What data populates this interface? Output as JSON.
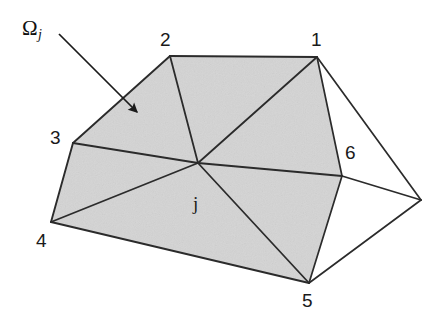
{
  "figure": {
    "background_color": "#ffffff",
    "shaded_fill_color": "#d4d4d4",
    "line_color": "#2b2b2b",
    "canvas": {
      "width": 439,
      "height": 323
    },
    "region_label": {
      "base": "Ω",
      "subscript": "j",
      "x": 22,
      "y": 18
    },
    "arrow": {
      "name": "omega-pointer-arrow",
      "start": {
        "x": 59,
        "y": 34
      },
      "end": {
        "x": 137,
        "y": 112
      }
    },
    "center_node": {
      "label": "j",
      "x": 198,
      "y": 163,
      "label_x": 193,
      "label_y": 194
    },
    "vertices": [
      {
        "id": "1",
        "x": 317,
        "y": 57,
        "label_x": 311,
        "label_y": 30
      },
      {
        "id": "2",
        "x": 170,
        "y": 56,
        "label_x": 160,
        "label_y": 30
      },
      {
        "id": "3",
        "x": 73,
        "y": 143,
        "label_x": 50,
        "label_y": 128
      },
      {
        "id": "4",
        "x": 51,
        "y": 222,
        "label_x": 36,
        "label_y": 231
      },
      {
        "id": "5",
        "x": 309,
        "y": 283,
        "label_x": 302,
        "label_y": 291
      },
      {
        "id": "6",
        "x": 342,
        "y": 176,
        "label_x": 345,
        "label_y": 143
      },
      {
        "id": "7",
        "x": 421,
        "y": 200,
        "label_x": null,
        "label_y": null
      }
    ],
    "shaded_polygon": [
      {
        "x": 170,
        "y": 56
      },
      {
        "x": 317,
        "y": 57
      },
      {
        "x": 342,
        "y": 176
      },
      {
        "x": 309,
        "y": 283
      },
      {
        "x": 51,
        "y": 222
      },
      {
        "x": 73,
        "y": 143
      }
    ],
    "outer_polygon": [
      {
        "x": 170,
        "y": 56
      },
      {
        "x": 317,
        "y": 57
      },
      {
        "x": 421,
        "y": 200
      },
      {
        "x": 309,
        "y": 283
      },
      {
        "x": 51,
        "y": 222
      },
      {
        "x": 73,
        "y": 143
      }
    ],
    "spoke_edges": [
      {
        "from": "j",
        "to": "1",
        "x1": 198,
        "y1": 163,
        "x2": 317,
        "y2": 57
      },
      {
        "from": "j",
        "to": "2",
        "x1": 198,
        "y1": 163,
        "x2": 170,
        "y2": 56
      },
      {
        "from": "j",
        "to": "3",
        "x1": 198,
        "y1": 163,
        "x2": 73,
        "y2": 143
      },
      {
        "from": "j",
        "to": "4",
        "x1": 198,
        "y1": 163,
        "x2": 51,
        "y2": 222
      },
      {
        "from": "j",
        "to": "5",
        "x1": 198,
        "y1": 163,
        "x2": 309,
        "y2": 283
      },
      {
        "from": "j",
        "to": "6",
        "x1": 198,
        "y1": 163,
        "x2": 342,
        "y2": 176
      }
    ],
    "outer_edges": [
      {
        "from": "1",
        "to": "6",
        "x1": 317,
        "y1": 57,
        "x2": 342,
        "y2": 176
      },
      {
        "from": "1",
        "to": "7",
        "x1": 317,
        "y1": 57,
        "x2": 421,
        "y2": 200
      },
      {
        "from": "6",
        "to": "7",
        "x1": 342,
        "y1": 176,
        "x2": 421,
        "y2": 200
      },
      {
        "from": "6",
        "to": "5",
        "x1": 342,
        "y1": 176,
        "x2": 309,
        "y2": 283
      },
      {
        "from": "5",
        "to": "7",
        "x1": 309,
        "y1": 283,
        "x2": 421,
        "y2": 200
      }
    ],
    "boundary_edges": [
      {
        "from": "2",
        "to": "1",
        "x1": 170,
        "y1": 56,
        "x2": 317,
        "y2": 57
      },
      {
        "from": "2",
        "to": "3",
        "x1": 170,
        "y1": 56,
        "x2": 73,
        "y2": 143
      },
      {
        "from": "3",
        "to": "4",
        "x1": 73,
        "y1": 143,
        "x2": 51,
        "y2": 222
      },
      {
        "from": "4",
        "to": "5",
        "x1": 51,
        "y1": 222,
        "x2": 309,
        "y2": 283
      }
    ]
  }
}
